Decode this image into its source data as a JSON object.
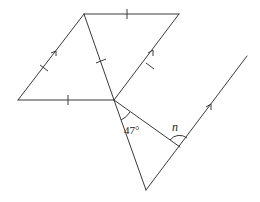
{
  "diagram": {
    "type": "geometry",
    "points": {
      "A": [
        84,
        14
      ],
      "B": [
        179,
        14
      ],
      "C": [
        18,
        100
      ],
      "O": [
        114,
        100
      ],
      "P": [
        146,
        190
      ],
      "Q": [
        180,
        147
      ],
      "R": [
        247,
        56
      ]
    },
    "segments": [
      {
        "from": "A",
        "to": "B",
        "mark": "single-tick"
      },
      {
        "from": "A",
        "to": "C",
        "mark": "single-tick-and-arrow"
      },
      {
        "from": "C",
        "to": "O",
        "mark": "single-tick"
      },
      {
        "from": "A",
        "to": "O",
        "mark": "single-tick"
      },
      {
        "from": "O",
        "to": "B",
        "mark": "single-tick-and-arrow"
      },
      {
        "from": "O",
        "to": "P",
        "mark": "none"
      },
      {
        "from": "O",
        "to": "Q",
        "mark": "none"
      },
      {
        "from": "P",
        "to": "R",
        "mark": "arrow"
      }
    ],
    "labels": {
      "angle_at_O": "47°",
      "angle_at_Q": "n"
    }
  }
}
